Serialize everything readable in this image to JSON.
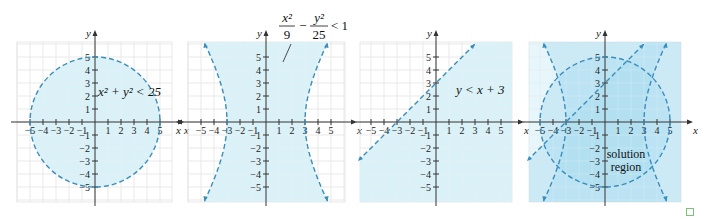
{
  "chart_data": [
    {
      "type": "region",
      "title": "",
      "inequality": "x^2 + y^2 < 25",
      "label": "x² + y² < 25",
      "boundary": "circle radius 5 centered at origin (dashed)",
      "shaded": "interior of circle",
      "xlabel": "x",
      "ylabel": "y",
      "xticks": [
        -5,
        -4,
        -3,
        -2,
        -1,
        1,
        2,
        3,
        4,
        5
      ],
      "yticks": [
        -5,
        -4,
        -3,
        -2,
        -1,
        1,
        2,
        3,
        4,
        5
      ],
      "xlim": [
        -6,
        6
      ],
      "ylim": [
        -6,
        6
      ],
      "grid": true
    },
    {
      "type": "region",
      "inequality": "x^2/9 - y^2/25 < 1",
      "label_num_left": "x²",
      "label_den_left": "9",
      "label_num_right": "y²",
      "label_den_right": "25",
      "label_rhs": "< 1",
      "boundary": "hyperbola vertices (±3, 0), dashed, with arrows",
      "shaded": "region between branches",
      "xlabel": "x",
      "ylabel": "y",
      "xticks": [
        -5,
        -4,
        -3,
        -2,
        -1,
        1,
        2,
        3,
        4,
        5
      ],
      "yticks": [
        -5,
        -4,
        -3,
        -2,
        -1,
        1,
        2,
        3,
        4,
        5
      ],
      "xlim": [
        -6,
        6
      ],
      "ylim": [
        -6,
        6
      ],
      "grid": true
    },
    {
      "type": "region",
      "inequality": "y < x + 3",
      "label": "y < x + 3",
      "boundary": "line y = x + 3 (dashed, with arrows)",
      "shaded": "below the line",
      "xlabel": "x",
      "ylabel": "y",
      "xticks": [
        -5,
        -4,
        -3,
        -2,
        -1,
        1,
        2,
        3,
        4,
        5
      ],
      "yticks": [
        -5,
        -4,
        -3,
        -2,
        -1,
        1,
        2,
        3,
        4,
        5
      ],
      "xlim": [
        -6,
        6
      ],
      "ylim": [
        -6,
        6
      ],
      "grid": true
    },
    {
      "type": "region",
      "inequality": "system of all three",
      "label": "solution region",
      "label_line1": "solution",
      "label_line2": "region",
      "boundary": "overlay of circle, hyperbola, and line (dashed)",
      "shaded": "intersection of all three regions (darkest)",
      "xlabel": "x",
      "ylabel": "y",
      "xticks": [
        -5,
        -4,
        -3,
        -2,
        -1,
        1,
        2,
        3,
        4,
        5
      ],
      "yticks": [
        -5,
        -4,
        -3,
        -2,
        -1,
        1,
        2,
        3,
        4,
        5
      ],
      "xlim": [
        -6,
        6
      ],
      "ylim": [
        -6,
        6
      ],
      "grid": true
    }
  ],
  "panels": {
    "p1": {
      "eq": "x² + y² < 25"
    },
    "p2": {
      "num1": "x²",
      "den1": "9",
      "minus": "−",
      "num2": "y²",
      "den2": "25",
      "rhs": "< 1"
    },
    "p3": {
      "eq": "y < x + 3"
    },
    "p4": {
      "line1": "solution",
      "line2": "region"
    }
  },
  "axes": {
    "x": "x",
    "y": "y"
  },
  "colors": {
    "shade": "#d4eef7",
    "shade2": "#a9dcef",
    "shade3": "#6cc3e6",
    "boundary": "#3a8dbd",
    "grid": "#d9d9d9",
    "axis": "#333333"
  }
}
